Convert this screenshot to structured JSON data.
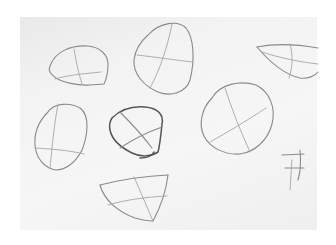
{
  "scene": {
    "description": "Photograph of pencil sketches on white paper: rough head/egg shapes with crosshair construction guidelines",
    "paper_color": "#f3f3f3",
    "border_color": "#ffffff",
    "pencil_color": "#8a8a8a",
    "sketch_count": 8
  },
  "sketches": [
    {
      "name": "rounded-box-top-left",
      "cx": 80,
      "cy": 80
    },
    {
      "name": "tilted-oval-top-center",
      "cx": 165,
      "cy": 60
    },
    {
      "name": "almond-top-right",
      "cx": 295,
      "cy": 62
    },
    {
      "name": "tall-oval-left",
      "cx": 60,
      "cy": 148
    },
    {
      "name": "dark-rounded-shape-center",
      "cx": 138,
      "cy": 132
    },
    {
      "name": "large-oval-right",
      "cx": 237,
      "cy": 117
    },
    {
      "name": "shield-bottom-center",
      "cx": 140,
      "cy": 200
    },
    {
      "name": "small-mark-bottom-right",
      "cx": 295,
      "cy": 165
    }
  ]
}
